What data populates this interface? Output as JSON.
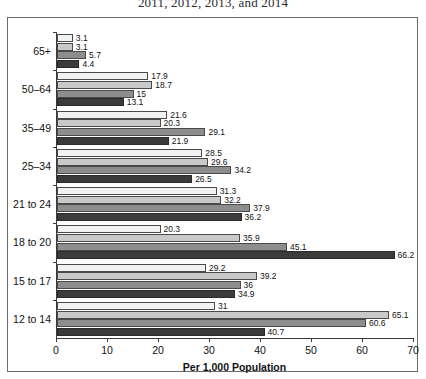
{
  "chart_data": {
    "type": "bar",
    "orientation": "horizontal",
    "title": "2011, 2012, 2013, and 2014",
    "xlabel": "Per 1,000 Population",
    "ylabel": "",
    "xlim": [
      0,
      70
    ],
    "xticks": [
      0,
      10,
      20,
      30,
      40,
      50,
      60,
      70
    ],
    "grid": false,
    "legend": "none",
    "categories": [
      "65+",
      "50–64",
      "35–49",
      "25–34",
      "21 to 24",
      "18 to 20",
      "15 to 17",
      "12 to 14"
    ],
    "series": [
      {
        "name": "2011",
        "color": "#f2f2f2",
        "values": [
          3.1,
          17.9,
          21.6,
          28.5,
          31.3,
          20.3,
          29.2,
          31
        ]
      },
      {
        "name": "2012",
        "color": "#c9c9c9",
        "values": [
          3.1,
          18.7,
          20.3,
          29.6,
          32.2,
          35.9,
          39.2,
          65.1
        ]
      },
      {
        "name": "2013",
        "color": "#8d8d8d",
        "values": [
          5.7,
          15,
          29.1,
          34.2,
          37.9,
          45.1,
          36,
          60.6
        ]
      },
      {
        "name": "2014",
        "color": "#3b3b3b",
        "values": [
          4.4,
          13.1,
          21.9,
          26.5,
          36.2,
          66.2,
          34.9,
          40.7
        ]
      }
    ],
    "value_labels": [
      [
        "3.1",
        "3.1",
        "5.7",
        "4.4"
      ],
      [
        "17.9",
        "18.7",
        "15",
        "13.1"
      ],
      [
        "21.6",
        "20.3",
        "29.1",
        "21.9"
      ],
      [
        "28.5",
        "29.6",
        "34.2",
        "26.5"
      ],
      [
        "31.3",
        "32.2",
        "37.9",
        "36.2"
      ],
      [
        "20.3",
        "35.9",
        "45.1",
        "66.2"
      ],
      [
        "29.2",
        "39.2",
        "36",
        "34.9"
      ],
      [
        "31",
        "65.1",
        "60.6",
        "40.7"
      ]
    ]
  }
}
